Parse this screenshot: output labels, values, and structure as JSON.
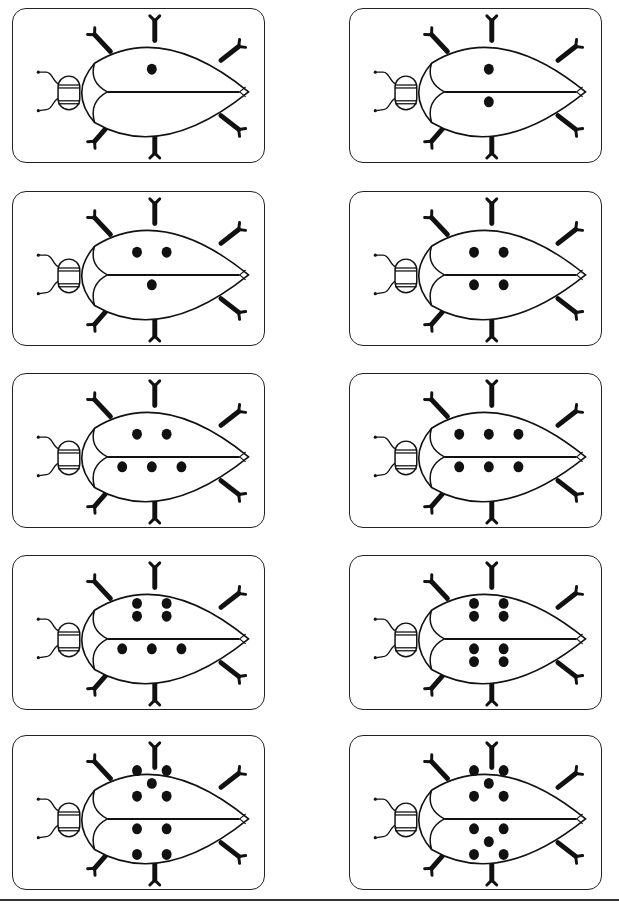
{
  "page": {
    "title": "",
    "background": "#ffffff",
    "ink_color": "#111111"
  },
  "cards": [
    {
      "row": 1,
      "col": 1,
      "spots": 1,
      "top_spots": [
        [
          0,
          -1
        ]
      ],
      "bottom_spots": []
    },
    {
      "row": 1,
      "col": 2,
      "spots": 2,
      "top_spots": [
        [
          0,
          -1
        ]
      ],
      "bottom_spots": [
        [
          0,
          -1
        ]
      ]
    },
    {
      "row": 2,
      "col": 1,
      "spots": 3,
      "top_spots": [
        [
          -1,
          -1
        ],
        [
          1,
          -1
        ]
      ],
      "bottom_spots": [
        [
          0,
          -1
        ]
      ]
    },
    {
      "row": 2,
      "col": 2,
      "spots": 4,
      "top_spots": [
        [
          -1,
          -1
        ],
        [
          1,
          -1
        ]
      ],
      "bottom_spots": [
        [
          -1,
          -1
        ],
        [
          1,
          -1
        ]
      ]
    },
    {
      "row": 3,
      "col": 1,
      "spots": 5,
      "top_spots": [
        [
          -1,
          -1
        ],
        [
          1,
          -1
        ]
      ],
      "bottom_spots": [
        [
          -2,
          -1
        ],
        [
          0,
          -1
        ],
        [
          2,
          -1
        ]
      ]
    },
    {
      "row": 3,
      "col": 2,
      "spots": 6,
      "top_spots": [
        [
          -2,
          -1
        ],
        [
          0,
          -1
        ],
        [
          2,
          -1
        ]
      ],
      "bottom_spots": [
        [
          -2,
          -1
        ],
        [
          0,
          -1
        ],
        [
          2,
          -1
        ]
      ]
    },
    {
      "row": 4,
      "col": 1,
      "spots": 7,
      "top_spots": [
        [
          -1,
          -2
        ],
        [
          1,
          -2
        ],
        [
          -1,
          -1
        ],
        [
          1,
          -1
        ]
      ],
      "bottom_spots": [
        [
          -2,
          -1
        ],
        [
          0,
          -1
        ],
        [
          2,
          -1
        ]
      ]
    },
    {
      "row": 4,
      "col": 2,
      "spots": 8,
      "top_spots": [
        [
          -1,
          -2
        ],
        [
          1,
          -2
        ],
        [
          -1,
          -1
        ],
        [
          1,
          -1
        ]
      ],
      "bottom_spots": [
        [
          -1,
          -1
        ],
        [
          1,
          -1
        ],
        [
          -1,
          -2
        ],
        [
          1,
          -2
        ]
      ]
    },
    {
      "row": 5,
      "col": 1,
      "spots": 9,
      "top_spots": [
        [
          -1,
          -3
        ],
        [
          1,
          -3
        ],
        [
          0,
          -2
        ],
        [
          -1,
          -1
        ],
        [
          1,
          -1
        ]
      ],
      "bottom_spots": [
        [
          -1,
          -1
        ],
        [
          1,
          -1
        ],
        [
          -1,
          -3
        ],
        [
          1,
          -3
        ]
      ]
    },
    {
      "row": 5,
      "col": 2,
      "spots": 10,
      "top_spots": [
        [
          -1,
          -3
        ],
        [
          1,
          -3
        ],
        [
          0,
          -2
        ],
        [
          -1,
          -1
        ],
        [
          1,
          -1
        ]
      ],
      "bottom_spots": [
        [
          -1,
          -1
        ],
        [
          1,
          -1
        ],
        [
          0,
          -2
        ],
        [
          -1,
          -3
        ],
        [
          1,
          -3
        ]
      ]
    }
  ]
}
